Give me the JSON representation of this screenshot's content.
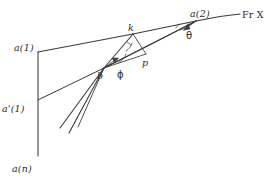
{
  "figure": {
    "kind": "hand-drawn-geometry-sketch",
    "background": "#ffffff",
    "ink_color": "#3a3a3a",
    "labels": {
      "a1": "a(1)",
      "a1_prime": "a'(1)",
      "an": "a(n)",
      "a2": "a(2)",
      "frx": "Fr X",
      "k": "k",
      "b": "b",
      "p": "p",
      "phi": "ϕ",
      "theta": "θ"
    },
    "label_positions": {
      "a1": {
        "x": 14,
        "y": 42
      },
      "a1_prime": {
        "x": 4,
        "y": 103
      },
      "an": {
        "x": 12,
        "y": 163
      },
      "a2": {
        "x": 192,
        "y": 10
      },
      "frx": {
        "x": 243,
        "y": 10
      },
      "k": {
        "x": 128,
        "y": 25
      },
      "b": {
        "x": 99,
        "y": 74
      },
      "p": {
        "x": 143,
        "y": 60
      },
      "phi": {
        "x": 118,
        "y": 70
      },
      "theta": {
        "x": 188,
        "y": 31
      }
    },
    "points": {
      "a1": {
        "x": 38,
        "y": 52
      },
      "a1_prime": {
        "x": 38,
        "y": 100
      },
      "an": {
        "x": 38,
        "y": 150
      },
      "axis_top": {
        "x": 38,
        "y": 52
      },
      "axis_bot": {
        "x": 38,
        "y": 156
      },
      "b": {
        "x": 104,
        "y": 68
      },
      "k": {
        "x": 133,
        "y": 34
      },
      "p": {
        "x": 146,
        "y": 54
      },
      "a2": {
        "x": 196,
        "y": 21
      },
      "frx_end": {
        "x": 240,
        "y": 14
      },
      "tail1": {
        "x": 60,
        "y": 128
      },
      "tail2": {
        "x": 68,
        "y": 132
      },
      "tail3": {
        "x": 76,
        "y": 126
      }
    },
    "edges": [
      {
        "name": "axis-vertical",
        "from": "axis_top",
        "to": "axis_bot"
      },
      {
        "name": "baseline-a1-to-k",
        "from": "a1",
        "to": "k"
      },
      {
        "name": "chord-k-to-a2",
        "from": "k",
        "to": "a2"
      },
      {
        "name": "ray-b-to-k",
        "from": "b",
        "to": "k"
      },
      {
        "name": "ray-b-to-p",
        "from": "b",
        "to": "p"
      },
      {
        "name": "ray-b-to-a2",
        "from": "b",
        "to": "a2"
      },
      {
        "name": "segment-k-to-p",
        "from": "k",
        "to": "p"
      },
      {
        "name": "curve-b-to-frx",
        "from": "b",
        "to": "frx_end"
      },
      {
        "name": "tail-lower-1",
        "from": "tail1",
        "to": "b"
      },
      {
        "name": "tail-lower-2",
        "from": "tail2",
        "to": "b"
      },
      {
        "name": "tail-lower-3",
        "from": "tail3",
        "to": "b"
      },
      {
        "name": "tail-from-aprime",
        "from": "a1_prime",
        "to": "b"
      }
    ],
    "angle_marks": [
      {
        "name": "phi-arc-at-b",
        "vertex": "b",
        "label": "ϕ"
      },
      {
        "name": "theta-arc-at-a2",
        "vertex": "a2",
        "label": "θ"
      }
    ]
  }
}
